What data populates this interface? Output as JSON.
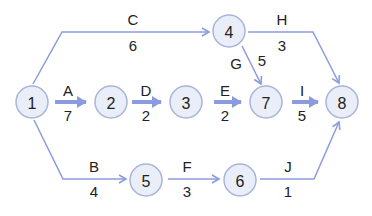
{
  "diagram": {
    "type": "activity-on-arrow network",
    "colors": {
      "edge": "#8c9be0",
      "node_fill": "#e9eef8",
      "node_stroke": "#a9b4d8",
      "text": "#222222"
    },
    "nodes": [
      {
        "id": "1",
        "label": "1",
        "x": 32,
        "y": 102
      },
      {
        "id": "2",
        "label": "2",
        "x": 111,
        "y": 102
      },
      {
        "id": "3",
        "label": "3",
        "x": 185,
        "y": 102
      },
      {
        "id": "4",
        "label": "4",
        "x": 229,
        "y": 31
      },
      {
        "id": "5",
        "label": "5",
        "x": 146,
        "y": 180
      },
      {
        "id": "6",
        "label": "6",
        "x": 239,
        "y": 180
      },
      {
        "id": "7",
        "label": "7",
        "x": 265,
        "y": 102
      },
      {
        "id": "8",
        "label": "8",
        "x": 342,
        "y": 102
      }
    ],
    "edges": [
      {
        "activity": "A",
        "duration": "7",
        "from": "1",
        "to": "2"
      },
      {
        "activity": "B",
        "duration": "4",
        "from": "1",
        "to": "5"
      },
      {
        "activity": "C",
        "duration": "6",
        "from": "1",
        "to": "4"
      },
      {
        "activity": "D",
        "duration": "2",
        "from": "2",
        "to": "3"
      },
      {
        "activity": "E",
        "duration": "2",
        "from": "3",
        "to": "7"
      },
      {
        "activity": "F",
        "duration": "3",
        "from": "5",
        "to": "6"
      },
      {
        "activity": "G",
        "duration": "5",
        "from": "4",
        "to": "7"
      },
      {
        "activity": "H",
        "duration": "3",
        "from": "4",
        "to": "8"
      },
      {
        "activity": "I",
        "duration": "5",
        "from": "7",
        "to": "8"
      },
      {
        "activity": "J",
        "duration": "1",
        "from": "6",
        "to": "8"
      }
    ]
  }
}
